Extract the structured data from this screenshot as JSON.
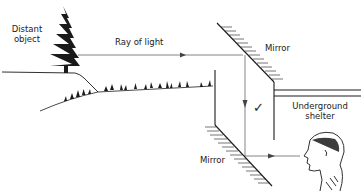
{
  "diagram": {
    "type": "periscope-light-path",
    "labels": {
      "distant_object_line1": "Distant",
      "distant_object_line2": "object",
      "ray": "Ray of light",
      "mirror_top": "Mirror",
      "mirror_bottom": "Mirror",
      "shelter_line1": "Underground",
      "shelter_line2": "shelter",
      "check": "✓"
    },
    "colors": {
      "ink": "#1a1a1a",
      "ray": "#666666",
      "background": "#ffffff"
    }
  }
}
